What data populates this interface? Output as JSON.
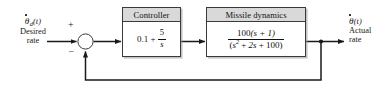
{
  "diagram": {
    "type": "control-system-block-diagram",
    "line_color": "#1a1a1a",
    "header_fill": "#d9d9d9",
    "block_fill": "#ffffff",
    "background": "#ffffff"
  },
  "input_signal": {
    "symbol_base": "θ",
    "symbol_subscript": "d",
    "symbol_arg": "(t)",
    "symbol_has_dot": true,
    "caption_line1": "Desired",
    "caption_line2": "rate"
  },
  "output_signal": {
    "symbol_base": "θ",
    "symbol_subscript": "",
    "symbol_arg": "(t)",
    "symbol_has_dot": true,
    "caption_line1": "Actual",
    "caption_line2": "rate"
  },
  "summing_junction": {
    "name": "summing-junction",
    "positive_sign": "+",
    "negative_sign": "−"
  },
  "blocks": [
    {
      "id": "controller",
      "header": "Controller",
      "expression": {
        "kind": "sum",
        "constant": "0.1",
        "operator": "+",
        "fraction": {
          "numerator": "5",
          "denominator": "s"
        }
      }
    },
    {
      "id": "missile-dynamics",
      "header": "Missile dynamics",
      "expression": {
        "kind": "fraction",
        "numerator": "100(s + 1)",
        "numerator_parts": {
          "gain": "100",
          "factor": "(s + 1)"
        },
        "denominator": "(s² + 2s + 100)",
        "denominator_parts": {
          "open": "(",
          "term1_base": "s",
          "term1_exp": "2",
          "op1": "+",
          "term2": "2s",
          "op2": "+",
          "term3": "100",
          "close": ")"
        }
      }
    }
  ],
  "feedback": {
    "name": "unity-feedback-path",
    "label": ""
  }
}
